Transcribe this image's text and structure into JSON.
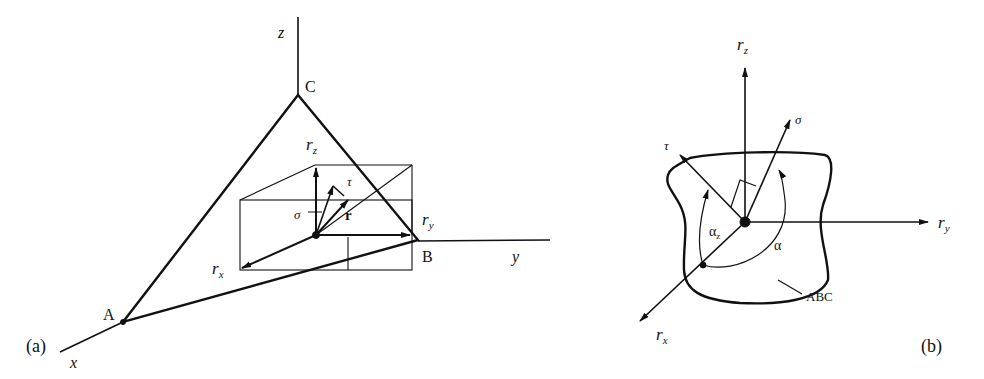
{
  "panel_a": {
    "caption": "(a)",
    "axes": {
      "x": "x",
      "y": "y",
      "z": "z"
    },
    "points": {
      "A": "A",
      "B": "B",
      "C": "C"
    },
    "vectors": {
      "r_x": "r",
      "r_x_sub": "x",
      "r_y": "r",
      "r_y_sub": "y",
      "r_z": "r",
      "r_z_sub": "z",
      "r": "r",
      "sigma": "σ",
      "tau": "τ"
    }
  },
  "panel_b": {
    "caption": "(b)",
    "vectors": {
      "r_x": "r",
      "r_x_sub": "x",
      "r_y": "r",
      "r_y_sub": "y",
      "r_z": "r",
      "r_z_sub": "z",
      "sigma": "σ",
      "tau": "τ"
    },
    "angles": {
      "alpha_z": "α",
      "alpha_z_sub": "z",
      "alpha": "α"
    },
    "surface_label": "ABC"
  }
}
